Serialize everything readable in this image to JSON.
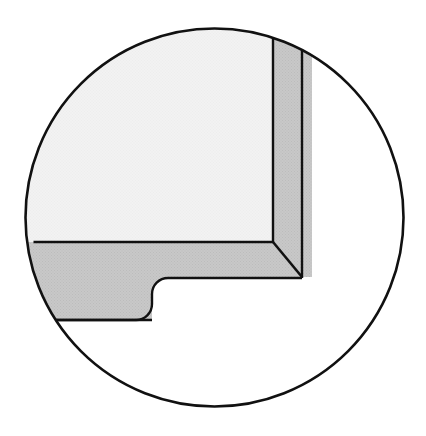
{
  "figure": {
    "kind": "engineering-detail-callout",
    "canvas": {
      "width": 426,
      "height": 436,
      "background": "#ffffff"
    },
    "colors": {
      "outline": "#111111",
      "background": "#ffffff",
      "face_light": "#f2f2f2",
      "face_gray": "#c8c8c8",
      "texture_dot": "#b4b4b4"
    },
    "detail_circle": {
      "name": "detail-boundary-circle",
      "center_x": 214.5,
      "center_y": 217.5,
      "radius": 190,
      "stroke_width": 2.6,
      "fill": "#ffffff"
    },
    "light_face": {
      "name": "inner-light-face",
      "fill": "#f2f2f2",
      "description": "Top-left interior face bounded by the detail circle arc, the vertical inner edge and the horizontal inner edge",
      "inner_vertical_edge_x": 273,
      "inner_horizontal_edge_y": 242,
      "arc_meet_top": {
        "x": 273,
        "y": 25
      },
      "arc_meet_left": {
        "x": 41,
        "y": 242
      }
    },
    "gray_band": {
      "name": "gray-section-band",
      "fill": "#c8c8c8",
      "description": "L-shaped sectioned wall thickness running along the right and bottom, joined by a 45 degree miter",
      "right_band": {
        "inner_x": 273,
        "outer_x": 302,
        "top_inner": {
          "x": 273,
          "y": 25
        },
        "top_outer": {
          "x": 302,
          "y": 38
        },
        "bottom_outer": {
          "x": 302,
          "y": 277
        }
      },
      "bottom_band": {
        "top_y": 242,
        "bottom_y": 320,
        "left_arc_top": {
          "x": 41,
          "y": 242
        },
        "left_arc_bottom": {
          "x": 61,
          "y": 320
        }
      },
      "miter": {
        "name": "miter-diagonal",
        "from": {
          "x": 273,
          "y": 242
        },
        "to": {
          "x": 302,
          "y": 277
        },
        "angle_deg": 45
      }
    },
    "notch": {
      "name": "filleted-notch",
      "description": "Rabbet step cut into the underside of the bottom band, closed by a rounded fillet",
      "shoulder_y": 278,
      "shoulder_from_x": 165,
      "shoulder_to_x": 302,
      "fillet_radius": 16,
      "fillet_start": {
        "x": 168,
        "y": 278
      },
      "fillet_end": {
        "x": 152,
        "y": 320
      },
      "floor_y": 320
    },
    "strokes": {
      "outline_width_circle": 2.6,
      "outline_width_edges": 2.4,
      "outline_width_thin": 1.8
    }
  },
  "labels": {
    "figure_caption": "",
    "annotations": []
  }
}
